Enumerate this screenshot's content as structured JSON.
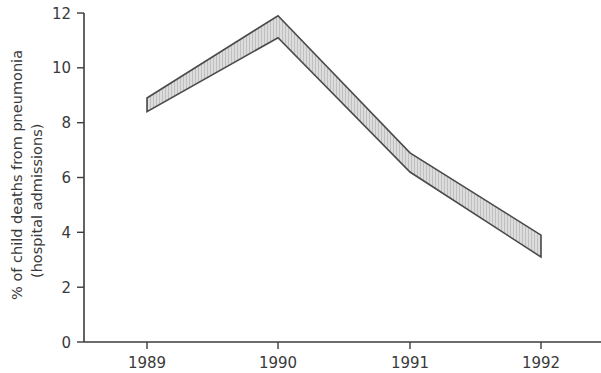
{
  "chart_data": {
    "type": "area",
    "title": "",
    "subtitle": "",
    "xlabel": "",
    "ylabel": "% of child deaths from pneumonia (hospital admissions)",
    "ylabel_line1": "% of child deaths from pneumonia",
    "ylabel_line2": "(hospital admissions)",
    "categories": [
      "1989",
      "1990",
      "1991",
      "1992"
    ],
    "x": [
      1989,
      1990,
      1991,
      1992
    ],
    "xtick_labels": [
      "1989",
      "1990",
      "1991",
      "1992"
    ],
    "ytick_labels": [
      "0",
      "2",
      "4",
      "6",
      "8",
      "10",
      "12"
    ],
    "ytick_values": [
      0,
      2,
      4,
      6,
      8,
      10,
      12
    ],
    "ylim": [
      0,
      12
    ],
    "xlim": [
      1988.5,
      1992.5
    ],
    "grid": false,
    "legend": null,
    "series": [
      {
        "name": "upper bound",
        "values": [
          8.9,
          11.9,
          6.9,
          3.9
        ]
      },
      {
        "name": "lower bound",
        "values": [
          8.4,
          11.1,
          6.2,
          3.1
        ]
      }
    ],
    "band": {
      "upper": [
        8.9,
        11.9,
        6.9,
        3.9
      ],
      "lower": [
        8.4,
        11.1,
        6.2,
        3.1
      ]
    },
    "colors": {
      "band_fill": "#d3d3d3",
      "band_stroke": "#4a4a4a",
      "axis": "#3c3c3c",
      "text": "#3a3a3a",
      "background": "#ffffff"
    }
  }
}
